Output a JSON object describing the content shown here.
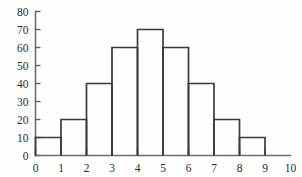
{
  "chart_data": {
    "type": "bar",
    "title": "",
    "subtitle": "",
    "xlabel": "",
    "ylabel": "",
    "grid": false,
    "legend": false,
    "bin_width": 1,
    "bin_edges": [
      0,
      1,
      2,
      3,
      4,
      5,
      6,
      7,
      8,
      9
    ],
    "categories": [
      "0-1",
      "1-2",
      "2-3",
      "3-4",
      "4-5",
      "5-6",
      "6-7",
      "7-8",
      "8-9"
    ],
    "values": [
      10,
      20,
      40,
      60,
      70,
      60,
      40,
      20,
      10
    ],
    "xlim": [
      0,
      10
    ],
    "ylim": [
      0,
      80
    ],
    "x_ticks": [
      0,
      1,
      2,
      3,
      4,
      5,
      6,
      7,
      8,
      9,
      10
    ],
    "y_ticks": [
      0,
      10,
      20,
      30,
      40,
      50,
      60,
      70,
      80
    ],
    "x_tick_labels": [
      "0",
      "1",
      "2",
      "3",
      "4",
      "5",
      "6",
      "7",
      "8",
      "9",
      "10"
    ],
    "y_tick_labels": [
      "0",
      "10",
      "20",
      "30",
      "40",
      "50",
      "60",
      "70",
      "80"
    ],
    "colors": {
      "background": "#fefefe",
      "axis": "#6e6e6e",
      "bar_outline": "#3b3b3b",
      "bar_fill": "none",
      "tick_label": "#2b2b2b"
    }
  }
}
